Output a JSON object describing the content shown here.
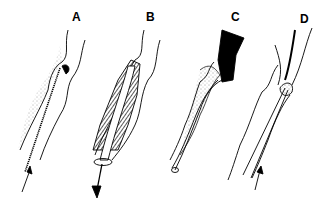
{
  "figure": {
    "panels": [
      {
        "label": "A",
        "x": 72,
        "y": 12
      },
      {
        "label": "B",
        "x": 147,
        "y": 12
      },
      {
        "label": "C",
        "x": 231,
        "y": 12
      },
      {
        "label": "D",
        "x": 300,
        "y": 14
      }
    ],
    "colors": {
      "ink": "#000000",
      "background": "#ffffff"
    }
  }
}
